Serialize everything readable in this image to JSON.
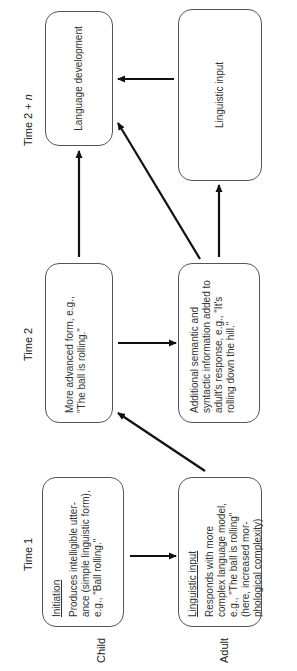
{
  "columns": [
    {
      "label": "Time 1"
    },
    {
      "label": "Time 2"
    },
    {
      "label_prefix": "Time 2 + ",
      "label_var": "n"
    }
  ],
  "rows": [
    {
      "label": "Child"
    },
    {
      "label": "Adult"
    }
  ],
  "boxes": {
    "child_time1": {
      "title": "Initiation",
      "text": "Produces intelligible utter-ance (simple linguistic form), e.g., \"Ball rolling.\""
    },
    "child_time2": {
      "text": "More advanced form, e.g., \"The ball is rolling.\""
    },
    "child_time2n": {
      "text": "Language development"
    },
    "adult_time1": {
      "title": "Linguistic input",
      "text": "Responds with more complex language model, e.g., \"The ball is rolling\" (here, increased mor-phological complexity)"
    },
    "adult_time2": {
      "text": "Additional semantic and syntactic information added to adult's response, e.g., \"It's rolling down the hill.\""
    },
    "adult_time2n": {
      "text": "Linguistic input"
    }
  },
  "arrows": [
    {
      "from": "child_time1",
      "to": "adult_time1"
    },
    {
      "from": "adult_time1",
      "to": "child_time2"
    },
    {
      "from": "child_time2",
      "to": "adult_time2"
    },
    {
      "from": "child_time2",
      "to": "child_time2n"
    },
    {
      "from": "adult_time2",
      "to": "child_time2n"
    },
    {
      "from": "adult_time2",
      "to": "adult_time2n"
    },
    {
      "from": "adult_time2n",
      "to": "child_time2n"
    }
  ]
}
